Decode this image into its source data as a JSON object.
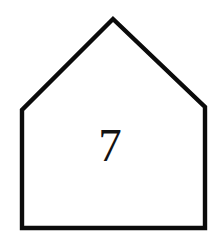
{
  "figure": {
    "name": "pentagon-shape-figure",
    "canvas": {
      "width": 222,
      "height": 242,
      "background_color": "#ffffff"
    },
    "shape": {
      "kind": "pentagon",
      "description": "house-outline pentagon",
      "points": "113,19 205,107 205,228 22,228 22,110",
      "stroke_color": "#0b0b0b",
      "fill_color": "#ffffff",
      "stroke_width": 4.4,
      "vertices": [
        {
          "label": "apex",
          "x": 113,
          "y": 19
        },
        {
          "label": "right-shoulder",
          "x": 205,
          "y": 107
        },
        {
          "label": "bottom-right",
          "x": 205,
          "y": 228
        },
        {
          "label": "bottom-left",
          "x": 22,
          "y": 228
        },
        {
          "label": "left-shoulder",
          "x": 22,
          "y": 110
        }
      ]
    },
    "label": {
      "text": "7",
      "color": "#121212",
      "font_size": 47,
      "x": 110,
      "y": 161
    }
  }
}
